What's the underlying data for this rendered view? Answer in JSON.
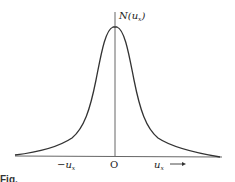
{
  "figure": {
    "y_label": "N(u",
    "y_label_sub": "x",
    "y_label_close": ")",
    "x_neg_label": "−u",
    "x_neg_sub": "x",
    "x_origin_label": "O",
    "x_pos_label": "u",
    "x_pos_sub": "x",
    "x_arrow": "→",
    "caption_fragment": "Fig."
  },
  "curve": {
    "shape": "symmetric bell-shaped (Lorentzian-like) distribution",
    "peak_x": 0,
    "description": "N(u_x) versus u_x, centered at O"
  },
  "colors": {
    "line": "#333333",
    "background": "#ffffff"
  }
}
